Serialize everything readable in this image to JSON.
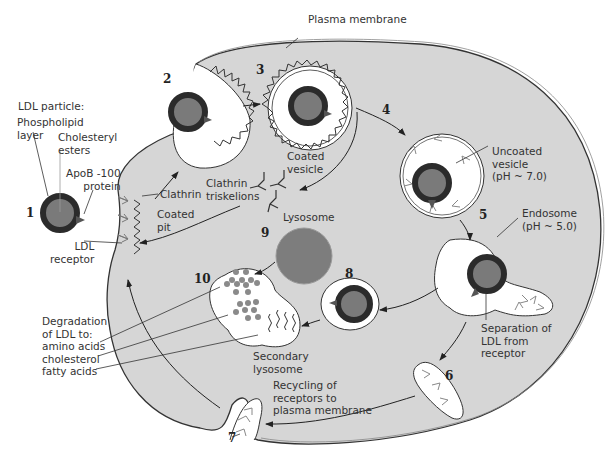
{
  "colors": {
    "cytoplasm": "#d6d6d6",
    "vesicle_interior": "#ffffff",
    "ldl_core": "#7a7a7a",
    "ldl_shell": "#2b2b2b",
    "lysosome": "#7d7d7d",
    "lines": "#333333"
  },
  "labels": {
    "plasma_membrane": "Plasma membrane",
    "ldl_particle": "LDL particle:",
    "phospholipid_1": "Phospholipid",
    "phospholipid_2": "layer",
    "cholesteryl_1": "Cholesteryl",
    "cholesteryl_2": "esters",
    "apob_1": "ApoB -100",
    "apob_2": "protein",
    "clathrin": "Clathrin",
    "coated_pit_1": "Coated",
    "coated_pit_2": "pit",
    "ldl_receptor_1": "LDL",
    "ldl_receptor_2": "receptor",
    "coated_vesicle_1": "Coated",
    "coated_vesicle_2": "vesicle",
    "triskelions_1": "Clathrin",
    "triskelions_2": "triskelions",
    "uncoated_1": "Uncoated",
    "uncoated_2": "vesicle",
    "uncoated_3": "(pH ~ 7.0)",
    "endosome_1": "Endosome",
    "endosome_2": "(pH ~ 5.0)",
    "separation_1": "Separation of",
    "separation_2": "LDL from",
    "separation_3": "receptor",
    "lysosome": "Lysosome",
    "secondary_1": "Secondary",
    "secondary_2": "lysosome",
    "degradation_1": "Degradation",
    "degradation_2": "of LDL to:",
    "amino_acids": "amino acids",
    "cholesterol": "cholesterol",
    "fatty_acids": "fatty acids",
    "recycling_1": "Recycling of",
    "recycling_2": "receptors to",
    "recycling_3": "plasma membrane"
  },
  "steps": [
    "1",
    "2",
    "3",
    "4",
    "5",
    "6",
    "7",
    "8",
    "9",
    "10"
  ]
}
